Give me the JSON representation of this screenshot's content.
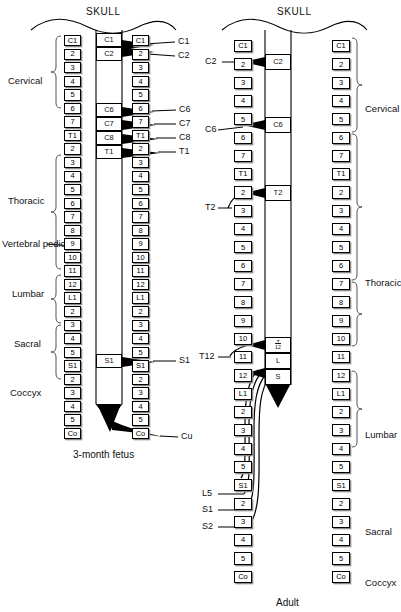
{
  "figure": {
    "left_panel": {
      "title": "SKULL",
      "caption": "3-month fetus",
      "region_labels": [
        "Cervical",
        "Thoracic",
        "Lumbar",
        "Sacral",
        "Coccyx"
      ],
      "annotation_label": "Vertebral pedicles",
      "vertebrae": [
        "C1",
        "2",
        "3",
        "4",
        "5",
        "6",
        "7",
        "T1",
        "2",
        "3",
        "4",
        "5",
        "6",
        "7",
        "8",
        "9",
        "10",
        "11",
        "12",
        "L1",
        "2",
        "3",
        "4",
        "5",
        "S1",
        "2",
        "3",
        "4",
        "5",
        "Co"
      ],
      "cord_segments": [
        "C1",
        "C2",
        "C6",
        "C7",
        "C8",
        "T1",
        "S1"
      ],
      "nerve_labels": [
        "C1",
        "C2",
        "C6",
        "C7",
        "C8",
        "T1",
        "S1",
        "Cu"
      ]
    },
    "right_panel": {
      "title": "SKULL",
      "caption": "Adult",
      "region_labels": [
        "Cervical",
        "Thoracic",
        "Lumbar",
        "Sacral",
        "Coccyx"
      ],
      "vertebrae": [
        "C1",
        "2",
        "3",
        "4",
        "5",
        "6",
        "7",
        "T1",
        "2",
        "3",
        "4",
        "5",
        "6",
        "7",
        "8",
        "9",
        "10",
        "11",
        "12",
        "L1",
        "2",
        "3",
        "4",
        "5",
        "S1",
        "2",
        "3",
        "4",
        "5",
        "Co"
      ],
      "cord_segments": [
        "C2",
        "C6",
        "T2",
        "T12",
        "L",
        "S"
      ],
      "cord_segment_T12_top": "T",
      "cord_segment_T12_bottom": "12",
      "nerve_labels": [
        "C2",
        "C6",
        "T2",
        "T12",
        "L5",
        "S1",
        "S2"
      ]
    }
  },
  "colors": {
    "ink": "#000000",
    "paper": "#ffffff",
    "shadow": "#8a8a8a"
  }
}
